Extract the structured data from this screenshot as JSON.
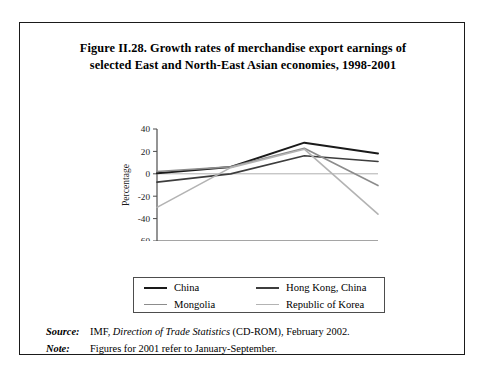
{
  "figure": {
    "title_line1": "Figure II.28.   Growth rates of merchandise export earnings of",
    "title_line2": "selected East and North-East Asian economies, 1998-2001"
  },
  "chart_data": {
    "type": "line",
    "title": "Figure II.28. Growth rates of merchandise export earnings of selected East and North-East Asian economies, 1998-2001",
    "xlabel": "",
    "ylabel": "Percentage",
    "categories": [
      "1998",
      "1999",
      "2000",
      "2001"
    ],
    "x": [
      1998,
      1999,
      2000,
      2001
    ],
    "ylim": [
      -60,
      40
    ],
    "yticks": [
      40,
      20,
      0,
      -20,
      -40,
      -60
    ],
    "ytick_labels": [
      "40",
      "20",
      "0",
      "-20",
      "-40",
      "-60"
    ],
    "xticks": [
      1998,
      1999,
      2000,
      2001
    ],
    "xtick_labels": [
      "1998",
      "1999",
      "2000",
      "2001"
    ],
    "grid": false,
    "zero_line": true,
    "legend_position": "bottom",
    "series": [
      {
        "name": "China",
        "color": "#1a1a1a",
        "width": 2.0,
        "values": [
          0.5,
          6.1,
          27.8,
          18.2
        ]
      },
      {
        "name": "Hong Kong, China",
        "color": "#3d3d3d",
        "width": 1.7,
        "values": [
          -7.5,
          0.0,
          16.1,
          11.0
        ]
      },
      {
        "name": "Mongolia",
        "color": "#8c8c8c",
        "width": 1.6,
        "values": [
          2.0,
          6.2,
          22.8,
          -10.5
        ]
      },
      {
        "name": "Republic of Korea",
        "color": "#b3b3b3",
        "width": 1.6,
        "values": [
          -30.0,
          5.5,
          22.0,
          -36.0
        ]
      }
    ]
  },
  "legend": {
    "items": [
      {
        "label": "China",
        "color": "#1a1a1a",
        "width": "2.2px"
      },
      {
        "label": "Hong Kong, China",
        "color": "#3d3d3d",
        "width": "2px"
      },
      {
        "label": "Mongolia",
        "color": "#8c8c8c",
        "width": "1.8px"
      },
      {
        "label": "Republic of Korea",
        "color": "#b3b3b3",
        "width": "1.8px"
      }
    ]
  },
  "notes": {
    "source_key": "Source:",
    "source_pre": "IMF, ",
    "source_italic": "Direction of Trade Statistics",
    "source_post": " (CD-ROM), February 2002.",
    "note_key": "Note:",
    "note_text": "Figures for 2001 refer to January-September."
  },
  "axis": {
    "ylabel": "Percentage"
  }
}
